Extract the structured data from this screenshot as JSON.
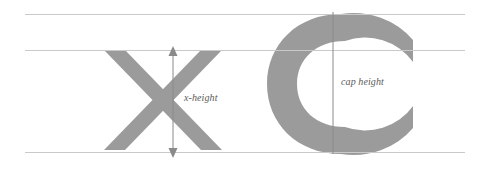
{
  "diagram": {
    "background_color": "#ffffff",
    "glyph_color": "#9b9b9b",
    "guide_color": "#c9c9c9",
    "label_color": "#5a5a5a",
    "guides": [
      {
        "name": "cap-height-line",
        "label": "cap height line",
        "y": 14
      },
      {
        "name": "x-height-line",
        "label": "x-height line",
        "y": 50
      },
      {
        "name": "baseline",
        "label": "baseline",
        "y": 152
      }
    ],
    "glyphs": [
      {
        "name": "letter-x",
        "character": "X",
        "spans": "x-height line to baseline"
      },
      {
        "name": "letter-c",
        "character": "C",
        "spans": "cap height line to baseline"
      }
    ],
    "annotations": [
      {
        "name": "x-height-measure",
        "label": "x-height",
        "style": "double-headed vertical arrow",
        "from_y": 50,
        "to_y": 152,
        "x": 173
      },
      {
        "name": "cap-height-measure",
        "label": "cap height",
        "style": "plain vertical line",
        "from_y": 14,
        "to_y": 152,
        "x": 333
      }
    ]
  }
}
